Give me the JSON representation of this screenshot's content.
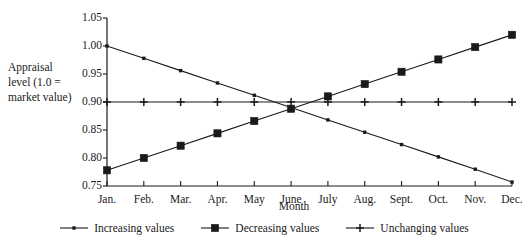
{
  "chart_data": {
    "type": "line",
    "title": "",
    "xlabel": "Month",
    "ylabel": "Appraisal level (1.0 = market value)",
    "ylabel_lines": [
      "Appraisal",
      "level (1.0 =",
      "market value)"
    ],
    "categories": [
      "Jan.",
      "Feb.",
      "Mar.",
      "Apr.",
      "May",
      "June",
      "July",
      "Aug.",
      "Sept.",
      "Oct.",
      "Nov.",
      "Dec."
    ],
    "ylim": [
      0.75,
      1.05
    ],
    "yticks": [
      1.05,
      1.0,
      0.95,
      0.9,
      0.85,
      0.8,
      0.75
    ],
    "ytick_labels": [
      "1.05",
      "1.00",
      "0.95",
      "0.90",
      "0.85",
      "0.80",
      "0.75"
    ],
    "grid": false,
    "legend_position": "bottom",
    "series": [
      {
        "name": "Increasing values",
        "marker": "small-dot",
        "color": "#1a1a1a",
        "values": [
          1.0,
          0.978,
          0.956,
          0.934,
          0.912,
          0.89,
          0.868,
          0.846,
          0.824,
          0.802,
          0.78,
          0.757
        ]
      },
      {
        "name": "Decreasing values",
        "marker": "filled-square",
        "color": "#1a1a1a",
        "values": [
          0.778,
          0.8,
          0.822,
          0.844,
          0.866,
          0.888,
          0.91,
          0.932,
          0.954,
          0.976,
          0.998,
          1.02
        ]
      },
      {
        "name": "Unchanging values",
        "marker": "plus",
        "color": "#1a1a1a",
        "values": [
          0.9,
          0.9,
          0.9,
          0.9,
          0.9,
          0.9,
          0.9,
          0.9,
          0.9,
          0.9,
          0.9,
          0.9
        ]
      }
    ]
  },
  "legend": {
    "items": [
      {
        "label": "Increasing values",
        "marker": "small-dot"
      },
      {
        "label": "Decreasing values",
        "marker": "filled-square"
      },
      {
        "label": "Unchanging values",
        "marker": "plus"
      }
    ]
  },
  "colors": {
    "ink": "#1a1a1a",
    "axis": "#1a1a1a",
    "background": "#ffffff"
  }
}
